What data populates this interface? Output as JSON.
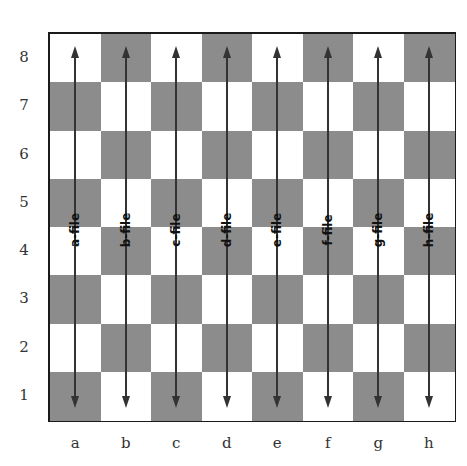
{
  "diagram": {
    "colors": {
      "light": "#ffffff",
      "dark": "#8c8c8c",
      "arrow": "#333333",
      "border": "#1a1a1a"
    },
    "ranks": [
      "8",
      "7",
      "6",
      "5",
      "4",
      "3",
      "2",
      "1"
    ],
    "files": [
      "a",
      "b",
      "c",
      "d",
      "e",
      "f",
      "g",
      "h"
    ],
    "file_labels": [
      "a-file",
      "b-file",
      "c-file",
      "d-file",
      "e-file",
      "f-file",
      "g-file",
      "h-file"
    ]
  }
}
